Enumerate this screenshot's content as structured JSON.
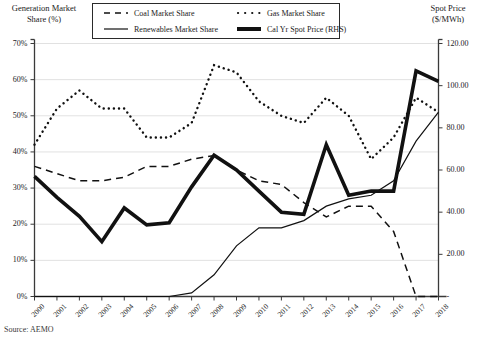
{
  "axes": {
    "left_title": "Generation Market\nShare (%)",
    "right_title": "Spot Price\n($/MWh)",
    "left_ticks": [
      "0%",
      "10%",
      "20%",
      "30%",
      "40%",
      "50%",
      "60%",
      "70%"
    ],
    "right_ticks": [
      "-",
      "20.00",
      "40.00",
      "60.00",
      "80.00",
      "100.00",
      "120.00"
    ]
  },
  "legend": {
    "items": [
      {
        "label": "Coal Market Share",
        "style": "dashed",
        "icon": "dashed-line-swatch"
      },
      {
        "label": "Gas Market Share",
        "style": "dotted",
        "icon": "dotted-line-swatch"
      },
      {
        "label": "Renewables Market Share",
        "style": "solid-thin",
        "icon": "solid-thin-line-swatch"
      },
      {
        "label": "Cal Yr Spot Price (RHS)",
        "style": "solid-thick",
        "icon": "solid-thick-line-swatch"
      }
    ]
  },
  "source": "Source: AEMO",
  "chart_data": {
    "type": "line",
    "title": "",
    "xlabel": "",
    "ylabel": "Generation Market Share (%)",
    "ylabel_secondary": "Spot Price ($/MWh)",
    "grid": true,
    "legend_position": "top-center",
    "categories": [
      2000,
      2001,
      2002,
      2003,
      2004,
      2005,
      2006,
      2007,
      2008,
      2009,
      2010,
      2011,
      2012,
      2013,
      2014,
      2015,
      2016,
      2017,
      2018
    ],
    "ylim": [
      0,
      70
    ],
    "ylim_secondary": [
      0,
      120
    ],
    "series": [
      {
        "name": "Coal Market Share",
        "axis": "left",
        "unit": "%",
        "values": [
          36,
          34,
          32,
          32,
          33,
          36,
          36,
          38,
          39,
          35,
          32,
          31,
          26,
          22,
          25,
          25,
          18,
          0,
          0
        ]
      },
      {
        "name": "Gas Market Share",
        "axis": "left",
        "unit": "%",
        "values": [
          42,
          52,
          57,
          52,
          52,
          44,
          44,
          48,
          64,
          62,
          54,
          50,
          48,
          55,
          50,
          38,
          44,
          55,
          51
        ]
      },
      {
        "name": "Renewables Market Share",
        "axis": "left",
        "unit": "%",
        "values": [
          0,
          0,
          0,
          0,
          0,
          0,
          0,
          1,
          6,
          14,
          19,
          19,
          21,
          25,
          27,
          28,
          32,
          43,
          51
        ]
      },
      {
        "name": "Cal Yr Spot Price (RHS)",
        "axis": "right",
        "unit": "$/MWh",
        "values": [
          57,
          47,
          38,
          26,
          42,
          34,
          35,
          52,
          67,
          60,
          50,
          40,
          39,
          72,
          48,
          50,
          50,
          107,
          102
        ]
      }
    ]
  }
}
